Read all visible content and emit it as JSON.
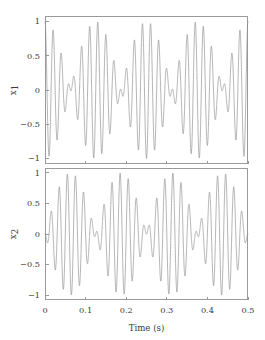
{
  "figure": {
    "background_color": "#ffffff",
    "line_color": "#8d8d8d",
    "axis_color": "#9a9a9a",
    "text_color": "#3b3b3b"
  },
  "chart_data": {
    "type": "line",
    "title": "",
    "subtitle": "",
    "xlabel": "Time (s)",
    "xlabel_parts": {
      "name": "Time",
      "unit": "(s)"
    },
    "xlim": [
      0,
      0.5
    ],
    "xticks": [
      0,
      0.1,
      0.2,
      0.3,
      0.4,
      0.5
    ],
    "xticklabels": [
      "0",
      "0.1",
      "0.2",
      "0.3",
      "0.4",
      "0.5"
    ],
    "grid": false,
    "legend": false,
    "legend_position": "none",
    "n_panels": 2,
    "shared_x": true,
    "panels": [
      {
        "index": 0,
        "ylabel": "x1",
        "ylabel_base": "x",
        "ylabel_sub": "1",
        "ylim": [
          -1.08,
          1.08
        ],
        "yticks": [
          -1,
          -0.5,
          0,
          0.5,
          1
        ],
        "yticklabels": [
          "−1",
          "−0.5",
          "0",
          "0.5",
          "1"
        ],
        "series": [
          {
            "name": "x1",
            "description": "Beat / amplitude-modulated waveform: sum of two sinusoids of nearly equal amplitude and close frequencies, producing an envelope with nulls near t = 0.125 s and t = 0.375 s and antinodes near t = 0, 0.25 and 0.5 s.",
            "model": "x1(t) = cos(2*pi*f1*t) + cos(2*pi*f2*t), normalized to peak 1",
            "f1_hz": 46,
            "f2_hz": 54,
            "carrier_hz": 50,
            "envelope_hz": 4,
            "envelope_phase_deg": 0,
            "amplitude_max": 1.0,
            "amplitude_min": -1.0
          }
        ]
      },
      {
        "index": 1,
        "ylabel": "x2",
        "ylabel_base": "x",
        "ylabel_sub": "2",
        "ylim": [
          -1.08,
          1.08
        ],
        "yticks": [
          -1,
          -0.5,
          0,
          0.5,
          1
        ],
        "yticklabels": [
          "−1",
          "−0.5",
          "0",
          "0.5",
          "1"
        ],
        "series": [
          {
            "name": "x2",
            "description": "Beat / amplitude-modulated waveform complementary to x1: envelope nulls near t = 0, 0.25 and 0.5 s with antinodes near t = 0.125 s and t = 0.375 s.",
            "model": "x2(t) = cos(2*pi*f1*t + pi) + cos(2*pi*f2*t), normalized to peak 1",
            "f1_hz": 46,
            "f2_hz": 54,
            "carrier_hz": 50,
            "envelope_hz": 4,
            "envelope_phase_deg": 180,
            "amplitude_max": 1.0,
            "amplitude_min": -1.0
          }
        ]
      }
    ]
  },
  "layout": {
    "plot_left": 45,
    "plot_right": 248,
    "panel1_top": 16,
    "panel1_bottom": 164,
    "panel2_top": 168,
    "panel2_bottom": 300,
    "tick_len": 3.5
  }
}
